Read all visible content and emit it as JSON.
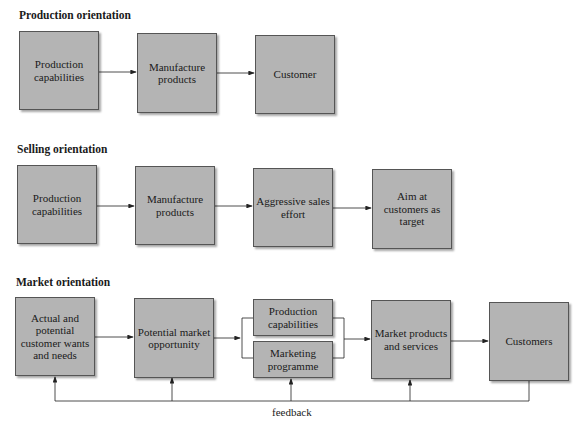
{
  "sections": [
    {
      "title": "Production orientation",
      "boxes": [
        "Production capabilities",
        "Manufacture products",
        "Customer"
      ]
    },
    {
      "title": "Selling orientation",
      "boxes": [
        "Production capabilities",
        "Manufacture products",
        "Aggressive sales effort",
        "Aim at customers as target"
      ]
    },
    {
      "title": "Market orientation",
      "boxes": [
        "Actual and potential customer wants and needs",
        "Potential market opportunity",
        "Production capabilities",
        "Marketing programme",
        "Market products and services",
        "Customers"
      ],
      "feedback_label": "feedback"
    }
  ],
  "colors": {
    "box_fill": "#b4b4b4",
    "border": "#555555",
    "line": "#222222"
  }
}
